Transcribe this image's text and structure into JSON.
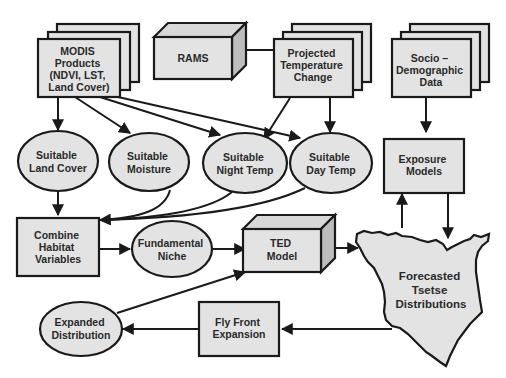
{
  "diagram": {
    "nodes": {
      "modis": {
        "lines": [
          "MODIS",
          "Products",
          "(NDVI, LST,",
          "Land Cover)"
        ],
        "shape": "stacked-document"
      },
      "rams": {
        "lines": [
          "RAMS"
        ],
        "shape": "3d-box"
      },
      "projected_temp": {
        "lines": [
          "Projected",
          "Temperature",
          "Change"
        ],
        "shape": "stacked-document"
      },
      "socio": {
        "lines": [
          "Socio –",
          "Demographic",
          "Data"
        ],
        "shape": "stacked-document"
      },
      "land_cover": {
        "lines": [
          "Suitable",
          "Land Cover"
        ],
        "shape": "ellipse"
      },
      "moisture": {
        "lines": [
          "Suitable",
          "Moisture"
        ],
        "shape": "ellipse"
      },
      "night_temp": {
        "lines": [
          "Suitable",
          "Night Temp"
        ],
        "shape": "ellipse"
      },
      "day_temp": {
        "lines": [
          "Suitable",
          "Day Temp"
        ],
        "shape": "ellipse"
      },
      "exposure": {
        "lines": [
          "Exposure",
          "Models"
        ],
        "shape": "rectangle"
      },
      "combine": {
        "lines": [
          "Combine",
          "Habitat",
          "Variables"
        ],
        "shape": "rectangle"
      },
      "niche": {
        "lines": [
          "Fundamental",
          "Niche"
        ],
        "shape": "ellipse"
      },
      "ted": {
        "lines": [
          "TED",
          "Model"
        ],
        "shape": "3d-box"
      },
      "forecast": {
        "lines": [
          "Forecasted",
          "Tsetse",
          "Distributions"
        ],
        "shape": "kenya-map"
      },
      "expanded": {
        "lines": [
          "Expanded",
          "Distribution"
        ],
        "shape": "ellipse"
      },
      "fly_front": {
        "lines": [
          "Fly Front",
          "Expansion"
        ],
        "shape": "rectangle"
      }
    },
    "edges": [
      {
        "from": "rams",
        "to": "projected_temp"
      },
      {
        "from": "modis",
        "to": "land_cover"
      },
      {
        "from": "modis",
        "to": "moisture"
      },
      {
        "from": "modis",
        "to": "night_temp"
      },
      {
        "from": "modis",
        "to": "day_temp"
      },
      {
        "from": "projected_temp",
        "to": "night_temp"
      },
      {
        "from": "projected_temp",
        "to": "day_temp"
      },
      {
        "from": "socio",
        "to": "exposure"
      },
      {
        "from": "land_cover",
        "to": "combine"
      },
      {
        "from": "moisture",
        "to": "combine"
      },
      {
        "from": "night_temp",
        "to": "combine"
      },
      {
        "from": "day_temp",
        "to": "combine"
      },
      {
        "from": "combine",
        "to": "niche"
      },
      {
        "from": "niche",
        "to": "ted"
      },
      {
        "from": "ted",
        "to": "forecast"
      },
      {
        "from": "forecast",
        "to": "exposure"
      },
      {
        "from": "exposure",
        "to": "forecast"
      },
      {
        "from": "forecast",
        "to": "fly_front"
      },
      {
        "from": "fly_front",
        "to": "expanded"
      },
      {
        "from": "expanded",
        "to": "ted"
      }
    ]
  }
}
